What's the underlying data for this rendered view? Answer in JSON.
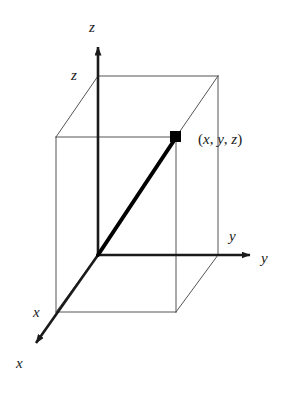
{
  "figure": {
    "type": "3d-coordinate-diagram",
    "background_color": "#ffffff",
    "line_color": "#1a1a1a",
    "box_edge_color": "#555555",
    "vector_color": "#000000"
  },
  "axes": [
    {
      "name": "z",
      "label": "z",
      "direction": "up",
      "arrow_tip": {
        "x": 98,
        "y": 42
      },
      "origin": {
        "x": 98,
        "y": 255
      }
    },
    {
      "name": "y",
      "label": "y",
      "direction": "right",
      "arrow_tip": {
        "x": 256,
        "y": 255
      },
      "origin": {
        "x": 98,
        "y": 255
      }
    },
    {
      "name": "x",
      "label": "x",
      "direction": "down-left",
      "arrow_tip": {
        "x": 30,
        "y": 349
      },
      "origin": {
        "x": 98,
        "y": 255
      }
    }
  ],
  "tick_labels": [
    {
      "name": "z-coordinate",
      "label": "z"
    },
    {
      "name": "y-coordinate",
      "label": "y"
    },
    {
      "name": "x-coordinate",
      "label": "x"
    }
  ],
  "point": {
    "label_open": "(",
    "label_x": "x",
    "comma_1": ", ",
    "label_y": "y",
    "comma_2": ", ",
    "label_z": "z",
    "label_close": ")",
    "marker": {
      "x": 176,
      "y": 137
    },
    "marker_shape": "filled-square"
  },
  "box": {
    "corners": {
      "top_back_left": {
        "x": 98,
        "y": 76
      },
      "top_back_right": {
        "x": 218,
        "y": 76
      },
      "top_front_right": {
        "x": 176,
        "y": 137
      },
      "top_front_left": {
        "x": 56,
        "y": 137
      },
      "bottom_back_left": {
        "x": 98,
        "y": 255
      },
      "bottom_back_right": {
        "x": 218,
        "y": 255
      },
      "bottom_front_right": {
        "x": 176,
        "y": 312
      },
      "bottom_front_left": {
        "x": 56,
        "y": 312
      }
    }
  },
  "vector": {
    "from": {
      "x": 98,
      "y": 255
    },
    "to": {
      "x": 176,
      "y": 137
    },
    "style": "thick-solid"
  }
}
